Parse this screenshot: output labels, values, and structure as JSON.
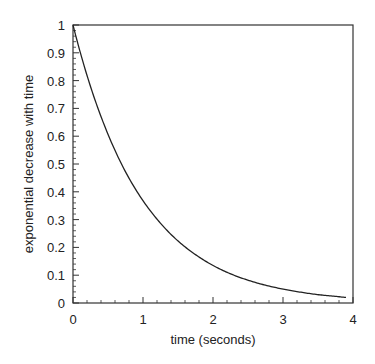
{
  "chart_data": {
    "type": "line",
    "title": "",
    "xlabel": "time (seconds)",
    "ylabel": "exponential decrease with time",
    "xlim": [
      0,
      4
    ],
    "ylim": [
      0,
      1
    ],
    "grid": false,
    "legend": null,
    "x_ticks": [
      "0",
      "1",
      "2",
      "3",
      "4"
    ],
    "y_ticks": [
      "0",
      "0.1",
      "0.2",
      "0.3",
      "0.4",
      "0.5",
      "0.6",
      "0.7",
      "0.8",
      "0.9",
      "1"
    ],
    "series": [
      {
        "name": "exp(-t)",
        "x": [
          0,
          0.25,
          0.5,
          0.75,
          1.0,
          1.25,
          1.5,
          1.75,
          2.0,
          2.25,
          2.5,
          2.75,
          3.0,
          3.25,
          3.5,
          3.75,
          3.9
        ],
        "values": [
          1.0,
          0.779,
          0.607,
          0.472,
          0.368,
          0.287,
          0.223,
          0.174,
          0.135,
          0.105,
          0.082,
          0.064,
          0.05,
          0.039,
          0.03,
          0.024,
          0.02
        ]
      }
    ]
  }
}
